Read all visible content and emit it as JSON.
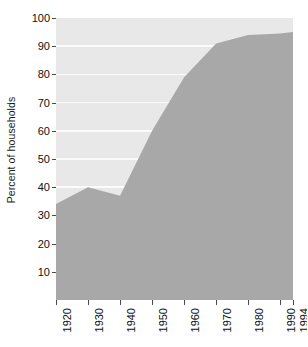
{
  "chart_data": {
    "type": "area",
    "title": "",
    "subtitle": "",
    "xlabel": "",
    "ylabel": "Percent of households",
    "x": [
      1920,
      1930,
      1940,
      1950,
      1960,
      1970,
      1980,
      1990,
      1994
    ],
    "categories": [
      "1920",
      "1930",
      "1940",
      "1950",
      "1960",
      "1970",
      "1980",
      "1990",
      "1994"
    ],
    "values": [
      34,
      40,
      37,
      60,
      79,
      91,
      94,
      94.5,
      95
    ],
    "series": [
      {
        "name": "Percent of households",
        "values": [
          34,
          40,
          37,
          60,
          79,
          91,
          94,
          94.5,
          95
        ]
      }
    ],
    "xlim": [
      1920,
      1994
    ],
    "ylim": [
      0,
      100
    ],
    "ytick_values": [
      10,
      20,
      30,
      40,
      50,
      60,
      70,
      80,
      90,
      100
    ],
    "ytick_labels": [
      "10",
      "20",
      "30",
      "40",
      "50",
      "60",
      "70",
      "80",
      "90",
      "100"
    ],
    "xtick_labels": [
      "1920",
      "1930",
      "1940",
      "1950",
      "1960",
      "1970",
      "1980",
      "1990",
      "1994"
    ],
    "grid": true,
    "grid_axis": "y",
    "grid_color": "#fbfbfb",
    "legend": false,
    "legend_position": "none",
    "annotations": [],
    "colors": {
      "area_fill": "#a8a8a8",
      "plot_background": "#e8e8e8",
      "figure_background": "#ffffff",
      "tick_color": "#4a4a4a",
      "text_color": "#111111",
      "axis_color": "#8a8a8a"
    }
  },
  "axes": {
    "y_title": "Percent of households",
    "y_ticks": [
      {
        "label": "100",
        "value": 100
      },
      {
        "label": "90",
        "value": 90
      },
      {
        "label": "80",
        "value": 80
      },
      {
        "label": "70",
        "value": 70
      },
      {
        "label": "60",
        "value": 60
      },
      {
        "label": "50",
        "value": 50
      },
      {
        "label": "40",
        "value": 40
      },
      {
        "label": "30",
        "value": 30
      },
      {
        "label": "20",
        "value": 20
      },
      {
        "label": "10",
        "value": 10
      }
    ],
    "x_ticks": [
      {
        "label": "1920",
        "value": 1920
      },
      {
        "label": "1930",
        "value": 1930
      },
      {
        "label": "1940",
        "value": 1940
      },
      {
        "label": "1950",
        "value": 1950
      },
      {
        "label": "1960",
        "value": 1960
      },
      {
        "label": "1970",
        "value": 1970
      },
      {
        "label": "1980",
        "value": 1980
      },
      {
        "label": "1990",
        "value": 1990
      },
      {
        "label": "1994",
        "value": 1994
      }
    ]
  }
}
